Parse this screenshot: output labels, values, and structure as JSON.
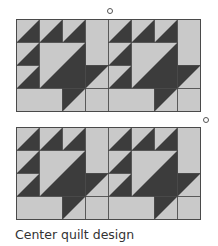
{
  "figure": {
    "caption": "Center quilt design",
    "colors": {
      "light": "#c9c9c9",
      "dark": "#3c3c3c",
      "line": "#4a4a4a"
    },
    "grid": {
      "columns": 8,
      "rows": 4,
      "cell_px": 23
    },
    "panels": [
      {
        "id": "top",
        "left": 16,
        "top": 19
      },
      {
        "id": "bottom",
        "left": 16,
        "top": 127
      }
    ],
    "markers": [
      {
        "id": "marker-top",
        "x": 108,
        "y": 10
      },
      {
        "id": "marker-right",
        "x": 204,
        "y": 118
      }
    ],
    "block_layout_note": "Two identical 4x4 basket-style blocks side by side; each panel repeated twice vertically"
  }
}
